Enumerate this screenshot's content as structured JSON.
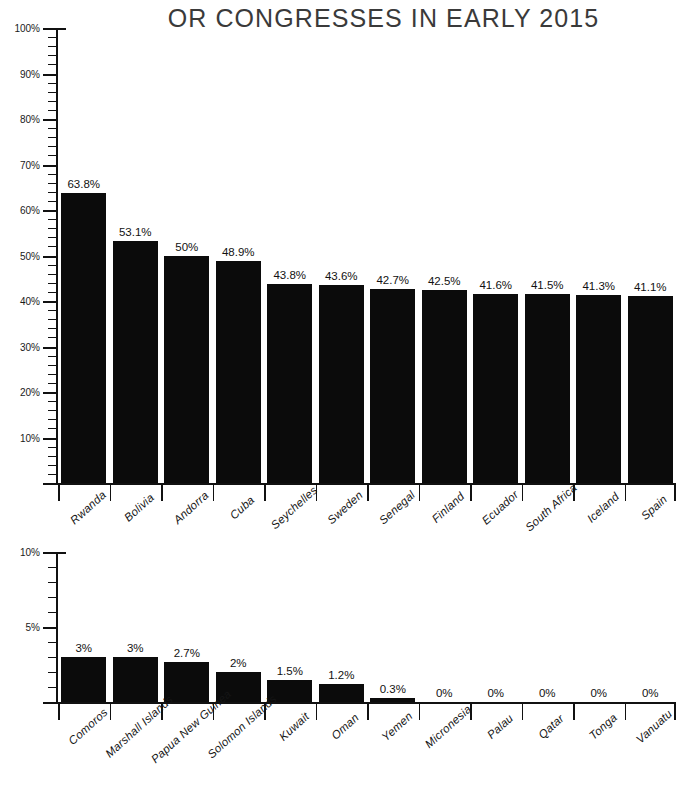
{
  "title": "OR CONGRESSES IN EARLY 2015",
  "colors": {
    "bar": "#0b0b0b",
    "axis": "#111111",
    "title": "#3a3a3a",
    "background": "#ffffff"
  },
  "chart_data": [
    {
      "type": "bar",
      "title": "OR CONGRESSES IN EARLY 2015",
      "panel": "top",
      "xlabel": "",
      "ylabel": "",
      "ylim": [
        0,
        100
      ],
      "grid": false,
      "legend": false,
      "y_major_step": 10,
      "y_minor_step": 2,
      "ytick_labels": [
        "10%",
        "20%",
        "30%",
        "40%",
        "50%",
        "60%",
        "70%",
        "80%",
        "90%",
        "100%"
      ],
      "categories": [
        "Rwanda",
        "Bolivia",
        "Andorra",
        "Cuba",
        "Seychelles",
        "Sweden",
        "Senegal",
        "Finland",
        "Ecuador",
        "South Africa",
        "Iceland",
        "Spain"
      ],
      "values": [
        63.8,
        53.1,
        50,
        48.9,
        43.8,
        43.6,
        42.7,
        42.5,
        41.6,
        41.5,
        41.3,
        41.1
      ],
      "value_labels": [
        "63.8%",
        "53.1%",
        "50%",
        "48.9%",
        "43.8%",
        "43.6%",
        "42.7%",
        "42.5%",
        "41.6%",
        "41.5%",
        "41.3%",
        "41.1%"
      ]
    },
    {
      "type": "bar",
      "title": "",
      "panel": "bottom",
      "xlabel": "",
      "ylabel": "",
      "ylim": [
        0,
        10
      ],
      "grid": false,
      "legend": false,
      "y_major_step": 5,
      "y_minor_step": 1,
      "ytick_labels": [
        "5%",
        "10%"
      ],
      "categories": [
        "Comoros",
        "Marshall Islands",
        "Papua New Guinea",
        "Solomon Islands",
        "Kuwait",
        "Oman",
        "Yemen",
        "Micronesia",
        "Palau",
        "Qatar",
        "Tonga",
        "Vanuatu"
      ],
      "values": [
        3,
        3,
        2.7,
        2,
        1.5,
        1.2,
        0.3,
        0,
        0,
        0,
        0,
        0
      ],
      "value_labels": [
        "3%",
        "3%",
        "2.7%",
        "2%",
        "1.5%",
        "1.2%",
        "0.3%",
        "0%",
        "0%",
        "0%",
        "0%",
        "0%"
      ]
    }
  ]
}
